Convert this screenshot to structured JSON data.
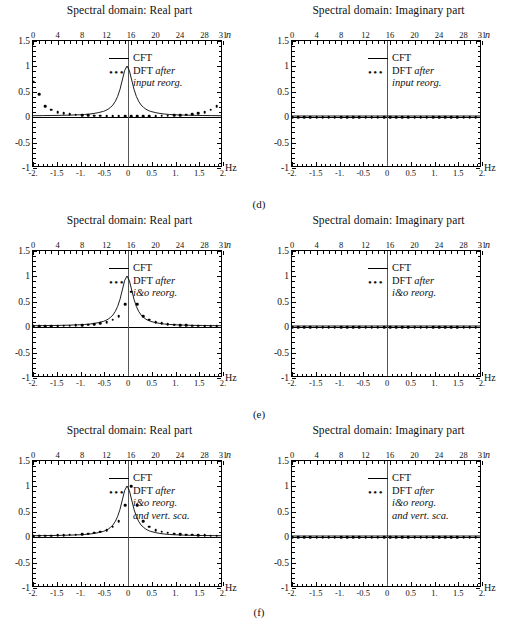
{
  "figure": {
    "panel_title_real": "Spectral domain: Real part",
    "panel_title_imag": "Spectral domain: Imaginary part",
    "captions": [
      "(d)",
      "(e)",
      "(f)"
    ],
    "axis": {
      "x_unit": "Hz",
      "n_unit": "n",
      "x_ticks": [
        "-2.",
        "-1.5",
        "-1.",
        "-0.5",
        "0",
        "0.5",
        "1.",
        "1.5",
        "2."
      ],
      "x_tick_values": [
        -2,
        -1.5,
        -1,
        -0.5,
        0,
        0.5,
        1,
        1.5,
        2
      ],
      "n_ticks": [
        "0",
        "4",
        "8",
        "12",
        "16",
        "20",
        "24",
        "28",
        "31"
      ],
      "n_tick_values": [
        0,
        4,
        8,
        12,
        16,
        20,
        24,
        28,
        31
      ],
      "y_ticks": [
        "1.5",
        "1",
        "0.5",
        "0",
        "-0.5",
        "-1"
      ],
      "y_tick_values": [
        1.5,
        1,
        0.5,
        0,
        -0.5,
        -1
      ],
      "xlim": [
        -2,
        2
      ],
      "ylim": [
        -1,
        1.5
      ],
      "nlim": [
        0,
        31
      ]
    },
    "legend": {
      "cft_label": "CFT",
      "dft_label": "DFT",
      "dots_glyph": "•••",
      "after_word": "after",
      "note_d": [
        "input reorg."
      ],
      "note_e": [
        "i&o reorg."
      ],
      "note_f": [
        "i&o reorg.",
        "and vert. sca."
      ]
    }
  },
  "chart_data": [
    {
      "id": "d-real",
      "type": "scatter",
      "title": "Spectral domain: Real part",
      "xlabel": "Hz",
      "ylabel": "",
      "xlim": [
        -2,
        2
      ],
      "ylim": [
        -1,
        1.5
      ],
      "grid": false,
      "legend_position": "upper-right",
      "series": [
        {
          "name": "CFT",
          "render": "line",
          "note": "Lorentzian peak of amplitude 1 centred at 0 Hz, half-width ~0.16 Hz",
          "x": [
            -2,
            -1.8,
            -1.6,
            -1.4,
            -1.2,
            -1,
            -0.9,
            -0.8,
            -0.7,
            -0.6,
            -0.5,
            -0.45,
            -0.4,
            -0.35,
            -0.3,
            -0.25,
            -0.2,
            -0.15,
            -0.1,
            -0.05,
            0,
            0.05,
            0.1,
            0.15,
            0.2,
            0.25,
            0.3,
            0.35,
            0.4,
            0.45,
            0.5,
            0.6,
            0.7,
            0.8,
            0.9,
            1,
            1.2,
            1.4,
            1.6,
            1.8,
            2
          ],
          "y": [
            0.006,
            0.008,
            0.01,
            0.013,
            0.018,
            0.025,
            0.031,
            0.039,
            0.051,
            0.069,
            0.093,
            0.112,
            0.138,
            0.173,
            0.22,
            0.29,
            0.39,
            0.53,
            0.72,
            0.91,
            1.0,
            0.91,
            0.72,
            0.53,
            0.39,
            0.29,
            0.22,
            0.173,
            0.138,
            0.112,
            0.093,
            0.069,
            0.051,
            0.039,
            0.031,
            0.025,
            0.018,
            0.013,
            0.01,
            0.008,
            0.006
          ]
        },
        {
          "name": "DFT after input reorg.",
          "render": "dots",
          "n": [
            0,
            1,
            2,
            3,
            4,
            5,
            6,
            7,
            8,
            9,
            10,
            11,
            12,
            13,
            14,
            15,
            16,
            17,
            18,
            19,
            20,
            21,
            22,
            23,
            24,
            25,
            26,
            27,
            28,
            29,
            30,
            31
          ],
          "values": [
            0.7,
            0.45,
            0.22,
            0.145,
            0.1,
            0.075,
            0.06,
            0.05,
            0.043,
            0.037,
            0.032,
            0.028,
            0.025,
            0.022,
            0.02,
            0.018,
            0.017,
            0.018,
            0.02,
            0.022,
            0.025,
            0.028,
            0.032,
            0.037,
            0.043,
            0.05,
            0.06,
            0.075,
            0.1,
            0.145,
            0.22,
            0.45
          ]
        }
      ]
    },
    {
      "id": "d-imag",
      "type": "scatter",
      "title": "Spectral domain: Imaginary part",
      "xlabel": "Hz",
      "xlim": [
        -2,
        2
      ],
      "ylim": [
        -1,
        1.5
      ],
      "grid": false,
      "legend_position": "upper-right",
      "series": [
        {
          "name": "CFT",
          "render": "line",
          "x": [
            -2,
            2
          ],
          "y": [
            0,
            0
          ]
        },
        {
          "name": "DFT after input reorg.",
          "render": "dots",
          "n": [
            0,
            1,
            2,
            3,
            4,
            5,
            6,
            7,
            8,
            9,
            10,
            11,
            12,
            13,
            14,
            15,
            16,
            17,
            18,
            19,
            20,
            21,
            22,
            23,
            24,
            25,
            26,
            27,
            28,
            29,
            30,
            31
          ],
          "values": [
            0,
            0,
            0,
            0,
            0,
            0,
            0,
            0,
            0,
            0,
            0,
            0,
            0,
            0,
            0,
            0,
            0,
            0,
            0,
            0,
            0,
            0,
            0,
            0,
            0,
            0,
            0,
            0,
            0,
            0,
            0,
            0
          ]
        }
      ]
    },
    {
      "id": "e-real",
      "type": "scatter",
      "title": "Spectral domain: Real part",
      "xlabel": "Hz",
      "xlim": [
        -2,
        2
      ],
      "ylim": [
        -1,
        1.5
      ],
      "grid": false,
      "legend_position": "upper-right",
      "series": [
        {
          "name": "CFT",
          "render": "line",
          "x": [
            -2,
            -1.8,
            -1.6,
            -1.4,
            -1.2,
            -1,
            -0.9,
            -0.8,
            -0.7,
            -0.6,
            -0.5,
            -0.45,
            -0.4,
            -0.35,
            -0.3,
            -0.25,
            -0.2,
            -0.15,
            -0.1,
            -0.05,
            0,
            0.05,
            0.1,
            0.15,
            0.2,
            0.25,
            0.3,
            0.35,
            0.4,
            0.45,
            0.5,
            0.6,
            0.7,
            0.8,
            0.9,
            1,
            1.2,
            1.4,
            1.6,
            1.8,
            2
          ],
          "y": [
            0.006,
            0.008,
            0.01,
            0.013,
            0.018,
            0.025,
            0.031,
            0.039,
            0.051,
            0.069,
            0.093,
            0.112,
            0.138,
            0.173,
            0.22,
            0.29,
            0.39,
            0.53,
            0.72,
            0.91,
            1.0,
            0.91,
            0.72,
            0.53,
            0.39,
            0.29,
            0.22,
            0.173,
            0.138,
            0.112,
            0.093,
            0.069,
            0.051,
            0.039,
            0.031,
            0.025,
            0.018,
            0.013,
            0.01,
            0.008,
            0.006
          ]
        },
        {
          "name": "DFT after i&o reorg.",
          "render": "dots",
          "note": "follows CFT shape but peak under-shoots to about 0.7",
          "n": [
            0,
            1,
            2,
            3,
            4,
            5,
            6,
            7,
            8,
            9,
            10,
            11,
            12,
            13,
            14,
            15,
            16,
            17,
            18,
            19,
            20,
            21,
            22,
            23,
            24,
            25,
            26,
            27,
            28,
            29,
            30,
            31
          ],
          "values": [
            0.017,
            0.018,
            0.02,
            0.022,
            0.025,
            0.028,
            0.032,
            0.037,
            0.043,
            0.05,
            0.06,
            0.075,
            0.1,
            0.145,
            0.22,
            0.45,
            0.7,
            0.45,
            0.22,
            0.145,
            0.1,
            0.075,
            0.06,
            0.05,
            0.043,
            0.037,
            0.032,
            0.028,
            0.025,
            0.022,
            0.02,
            0.018
          ]
        }
      ]
    },
    {
      "id": "e-imag",
      "type": "scatter",
      "title": "Spectral domain: Imaginary part",
      "xlabel": "Hz",
      "xlim": [
        -2,
        2
      ],
      "ylim": [
        -1,
        1.5
      ],
      "grid": false,
      "legend_position": "upper-right",
      "series": [
        {
          "name": "CFT",
          "render": "line",
          "x": [
            -2,
            2
          ],
          "y": [
            0,
            0
          ]
        },
        {
          "name": "DFT after i&o reorg.",
          "render": "dots",
          "n": [
            0,
            1,
            2,
            3,
            4,
            5,
            6,
            7,
            8,
            9,
            10,
            11,
            12,
            13,
            14,
            15,
            16,
            17,
            18,
            19,
            20,
            21,
            22,
            23,
            24,
            25,
            26,
            27,
            28,
            29,
            30,
            31
          ],
          "values": [
            0,
            0,
            0,
            0,
            0,
            0,
            0,
            0,
            0,
            0,
            0,
            0,
            0,
            0,
            0,
            0,
            0,
            0,
            0,
            0,
            0,
            0,
            0,
            0,
            0,
            0,
            0,
            0,
            0,
            0,
            0,
            0
          ]
        }
      ]
    },
    {
      "id": "f-real",
      "type": "scatter",
      "title": "Spectral domain: Real part",
      "xlabel": "Hz",
      "xlim": [
        -2,
        2
      ],
      "ylim": [
        -1,
        1.5
      ],
      "grid": false,
      "legend_position": "upper-right",
      "series": [
        {
          "name": "CFT",
          "render": "line",
          "x": [
            -2,
            -1.8,
            -1.6,
            -1.4,
            -1.2,
            -1,
            -0.9,
            -0.8,
            -0.7,
            -0.6,
            -0.5,
            -0.45,
            -0.4,
            -0.35,
            -0.3,
            -0.25,
            -0.2,
            -0.15,
            -0.1,
            -0.05,
            0,
            0.05,
            0.1,
            0.15,
            0.2,
            0.25,
            0.3,
            0.35,
            0.4,
            0.45,
            0.5,
            0.6,
            0.7,
            0.8,
            0.9,
            1,
            1.2,
            1.4,
            1.6,
            1.8,
            2
          ],
          "y": [
            0.006,
            0.008,
            0.01,
            0.013,
            0.018,
            0.025,
            0.031,
            0.039,
            0.051,
            0.069,
            0.093,
            0.112,
            0.138,
            0.173,
            0.22,
            0.29,
            0.39,
            0.53,
            0.72,
            0.91,
            1.0,
            0.91,
            0.72,
            0.53,
            0.39,
            0.29,
            0.22,
            0.173,
            0.138,
            0.112,
            0.093,
            0.069,
            0.051,
            0.039,
            0.031,
            0.025,
            0.018,
            0.013,
            0.01,
            0.008,
            0.006
          ]
        },
        {
          "name": "DFT after i&o reorg. and vert. sca.",
          "render": "dots",
          "note": "after vertical scaling the samples lie on the CFT curve",
          "n": [
            0,
            1,
            2,
            3,
            4,
            5,
            6,
            7,
            8,
            9,
            10,
            11,
            12,
            13,
            14,
            15,
            16,
            17,
            18,
            19,
            20,
            21,
            22,
            23,
            24,
            25,
            26,
            27,
            28,
            29,
            30,
            31
          ],
          "values": [
            0.024,
            0.026,
            0.029,
            0.032,
            0.036,
            0.041,
            0.046,
            0.053,
            0.062,
            0.072,
            0.086,
            0.107,
            0.143,
            0.21,
            0.32,
            0.63,
            1.0,
            0.63,
            0.32,
            0.21,
            0.143,
            0.107,
            0.086,
            0.072,
            0.062,
            0.053,
            0.046,
            0.041,
            0.036,
            0.032,
            0.029,
            0.026
          ]
        }
      ]
    },
    {
      "id": "f-imag",
      "type": "scatter",
      "title": "Spectral domain: Imaginary part",
      "xlabel": "Hz",
      "xlim": [
        -2,
        2
      ],
      "ylim": [
        -1,
        1.5
      ],
      "grid": false,
      "legend_position": "upper-right",
      "series": [
        {
          "name": "CFT",
          "render": "line",
          "x": [
            -2,
            2
          ],
          "y": [
            0,
            0
          ]
        },
        {
          "name": "DFT after i&o reorg. and vert. sca.",
          "render": "dots",
          "n": [
            0,
            1,
            2,
            3,
            4,
            5,
            6,
            7,
            8,
            9,
            10,
            11,
            12,
            13,
            14,
            15,
            16,
            17,
            18,
            19,
            20,
            21,
            22,
            23,
            24,
            25,
            26,
            27,
            28,
            29,
            30,
            31
          ],
          "values": [
            0,
            0,
            0,
            0,
            0,
            0,
            0,
            0,
            0,
            0,
            0,
            0,
            0,
            0,
            0,
            0,
            0,
            0,
            0,
            0,
            0,
            0,
            0,
            0,
            0,
            0,
            0,
            0,
            0,
            0,
            0,
            0
          ]
        }
      ]
    }
  ]
}
